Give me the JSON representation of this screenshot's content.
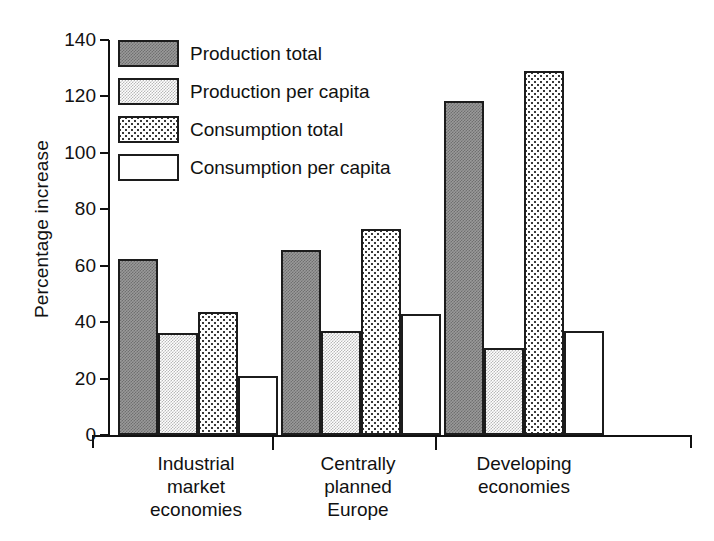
{
  "chart_data": {
    "type": "bar",
    "title": "",
    "xlabel": "",
    "ylabel": "Percentage increase",
    "ylim": [
      0,
      140
    ],
    "yticks": [
      0,
      20,
      40,
      60,
      80,
      100,
      120,
      140
    ],
    "ytick_labels": [
      "0",
      "20",
      "40",
      "60",
      "80",
      "100",
      "120",
      "140"
    ],
    "grid": false,
    "legend_position": "upper-left-inside",
    "categories": [
      "Industrial market economies",
      "Centrally planned Europe",
      "Developing economies"
    ],
    "category_lines": [
      [
        "Industrial",
        "market",
        "economies"
      ],
      [
        "Centrally",
        "planned",
        "Europe"
      ],
      [
        "Developing",
        "economies"
      ]
    ],
    "series": [
      {
        "name": "Production total",
        "pattern": "dark-grey-dither",
        "values": [
          62.5,
          65.5,
          118.5
        ]
      },
      {
        "name": "Production per capita",
        "pattern": "light-grey-dither",
        "values": [
          36.0,
          37.0,
          31.0
        ]
      },
      {
        "name": "Consumption total",
        "pattern": "checker-dots",
        "values": [
          43.5,
          73.0,
          129.0
        ]
      },
      {
        "name": "Consumption per capita",
        "pattern": "white",
        "values": [
          21.0,
          43.0,
          37.0
        ]
      }
    ]
  },
  "axis": {
    "y_label": "Percentage increase"
  },
  "legend": {
    "items": [
      {
        "label": "Production total",
        "swatch": "fill-prod-total"
      },
      {
        "label": "Production per capita",
        "swatch": "fill-prod-pc"
      },
      {
        "label": "Consumption total",
        "swatch": "fill-cons-total"
      },
      {
        "label": "Consumption per capita",
        "swatch": "fill-cons-pc"
      }
    ]
  },
  "artifact": {
    "top_strip_text": ""
  }
}
